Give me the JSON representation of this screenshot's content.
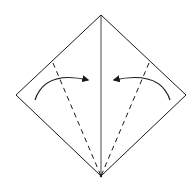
{
  "diagram": {
    "type": "origami-fold-step",
    "colors": {
      "background": "#ffffff",
      "stroke": "#1a1a1a"
    },
    "paper": {
      "shape": "diamond",
      "vertices": {
        "top": [
          101,
          15
        ],
        "right": [
          186,
          95
        ],
        "bottom": [
          101,
          176
        ],
        "left": [
          16,
          95
        ]
      }
    },
    "creases": [
      {
        "name": "center-crease",
        "style": "solid",
        "from": [
          101,
          15
        ],
        "to": [
          101,
          176
        ]
      }
    ],
    "fold_lines": [
      {
        "name": "left-valley-fold",
        "style": "dashed",
        "from": [
          53,
          63
        ],
        "to": [
          101,
          176
        ]
      },
      {
        "name": "right-valley-fold",
        "style": "dashed",
        "from": [
          149,
          63
        ],
        "to": [
          101,
          176
        ]
      }
    ],
    "arrows": [
      {
        "name": "left-fold-arrow",
        "direction": "toward-center",
        "from": [
          35,
          100
        ],
        "control": [
          50,
          68
        ],
        "to": [
          90,
          81
        ]
      },
      {
        "name": "right-fold-arrow",
        "direction": "toward-center",
        "from": [
          170,
          100
        ],
        "control": [
          155,
          68
        ],
        "to": [
          112,
          81
        ]
      }
    ]
  }
}
